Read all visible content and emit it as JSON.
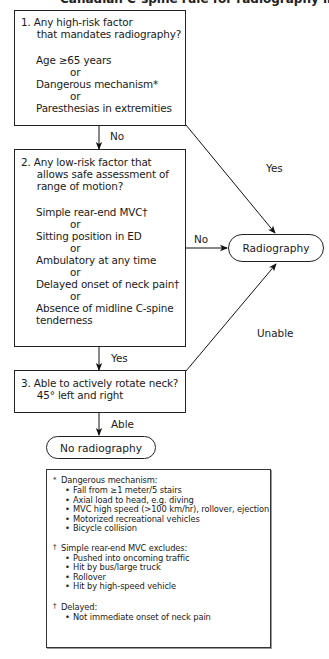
{
  "title_clipped": "Canadian C-spine rule for radiography in alert and stable trauma patients",
  "box1": {
    "question": [
      "1.  Any high-risk factor",
      "     that mandates radiography?"
    ],
    "criteria": [
      "Age ≥65 years",
      "or",
      "Dangerous mechanism*",
      "or",
      "Paresthesias in extremities"
    ]
  },
  "box2": {
    "question": [
      "2.  Any low-risk factor that",
      "     allows safe assessment of",
      "     range of motion?"
    ],
    "criteria": [
      "Simple rear-end MVC†",
      "or",
      "Sitting position in ED",
      "or",
      "Ambulatory at any time",
      "or",
      "Delayed onset of neck pain†",
      "or",
      "Absence of midline C-spine",
      "tenderness"
    ]
  },
  "box3": {
    "question": [
      "3.  Able to actively rotate neck?",
      "     45° left and right"
    ]
  },
  "outcomes": {
    "radiography": "Radiography",
    "no_radiography": "No radiography"
  },
  "edge_labels": {
    "box1_no": "No",
    "box1_yes": "Yes",
    "box2_no": "No",
    "box2_yes": "Yes",
    "box3_able": "Able",
    "box3_unable": "Unable"
  },
  "footnotes": {
    "dangerous": {
      "mark": "*",
      "heading": "Dangerous mechanism:",
      "items": [
        "Fall from ≥1 meter/5 stairs",
        "Axial load to head, e.g. diving",
        "MVC high speed (>100 km/hr), rollover, ejection",
        "Motorized recreational vehicles",
        "Bicycle collision"
      ]
    },
    "rear_end": {
      "mark": "†",
      "heading": "Simple rear-end MVC excludes:",
      "items": [
        "Pushed into oncoming traffic",
        "Hit by bus/large truck",
        "Rollover",
        "Hit by high-speed vehicle"
      ]
    },
    "delayed": {
      "mark": "†",
      "heading": "Delayed:",
      "items": [
        "Not immediate onset of neck pain"
      ]
    }
  }
}
